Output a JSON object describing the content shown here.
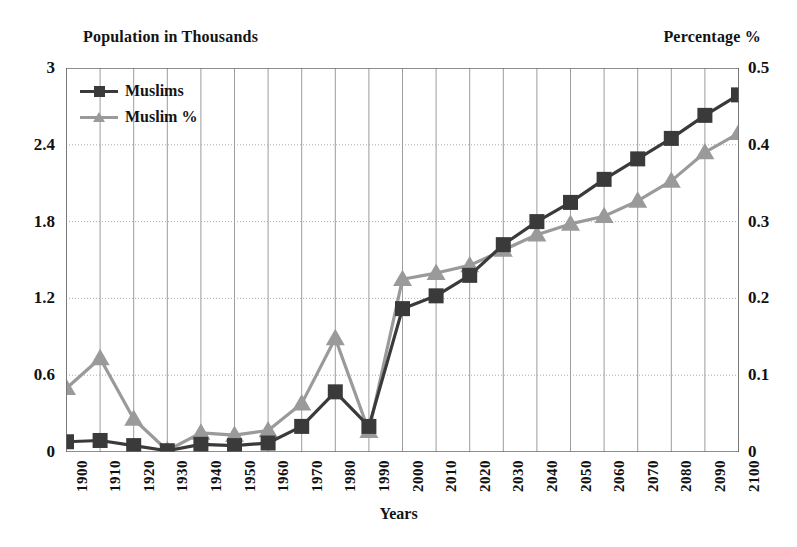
{
  "chart_data": {
    "type": "line",
    "title": "",
    "xlabel": "Years",
    "ylabel_left": "Population in Thousands",
    "ylabel_right": "Percentage %",
    "grid": true,
    "legend_position": "top-left",
    "categories": [
      "1900",
      "1910",
      "1920",
      "1930",
      "1940",
      "1950",
      "1960",
      "1970",
      "1980",
      "1990",
      "2000",
      "2010",
      "2020",
      "2030",
      "2040",
      "2050",
      "2060",
      "2070",
      "2080",
      "2090",
      "2100"
    ],
    "ylim_left": [
      0,
      3
    ],
    "yticks_left": [
      "0",
      "0.6",
      "1.2",
      "1.8",
      "2.4",
      "3"
    ],
    "ytick_values_left": [
      0,
      0.6,
      1.2,
      1.8,
      2.4,
      3
    ],
    "ylim_right": [
      0,
      0.5
    ],
    "yticks_right": [
      "0",
      "0.1",
      "0.2",
      "0.3",
      "0.4",
      "0.5"
    ],
    "ytick_values_right": [
      0,
      0.1,
      0.2,
      0.3,
      0.4,
      0.5
    ],
    "series": [
      {
        "name": "Muslims",
        "axis": "left",
        "marker": "square",
        "color": "#3a3a3a",
        "values": [
          0.08,
          0.09,
          0.05,
          0.01,
          0.06,
          0.05,
          0.07,
          0.2,
          0.47,
          0.2,
          1.12,
          1.22,
          1.38,
          1.62,
          1.8,
          1.95,
          2.13,
          2.29,
          2.45,
          2.63,
          2.79
        ]
      },
      {
        "name": "Muslim %",
        "axis": "right",
        "marker": "triangle",
        "color": "#9a9a9a",
        "values": [
          0.083,
          0.122,
          0.043,
          0.002,
          0.025,
          0.022,
          0.028,
          0.063,
          0.148,
          0.027,
          0.225,
          0.233,
          0.243,
          0.263,
          0.283,
          0.297,
          0.307,
          0.327,
          0.353,
          0.39,
          0.415
        ]
      }
    ]
  },
  "legend": {
    "items": [
      {
        "label": "Muslims",
        "color": "#3a3a3a",
        "marker": "square"
      },
      {
        "label": "Muslim %",
        "color": "#9a9a9a",
        "marker": "triangle"
      }
    ]
  },
  "axis_titles": {
    "left": "Population in Thousands",
    "right": "Percentage %",
    "bottom": "Years"
  },
  "colors": {
    "series_muslims": "#3a3a3a",
    "series_muslim_pct": "#9a9a9a",
    "grid": "#9d9d9d",
    "axis": "#6a6a6a",
    "text": "#131313",
    "background": "#ffffff"
  }
}
